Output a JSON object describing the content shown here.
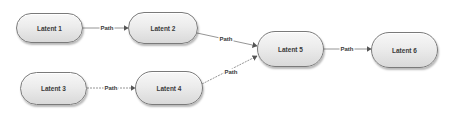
{
  "diagram": {
    "nodes": [
      {
        "id": "latent1",
        "label": "Latent 1",
        "x": 16,
        "y": 13,
        "w": 67,
        "h": 30
      },
      {
        "id": "latent2",
        "label": "Latent 2",
        "x": 128,
        "y": 12,
        "w": 70,
        "h": 32
      },
      {
        "id": "latent3",
        "label": "Latent 3",
        "x": 20,
        "y": 72,
        "w": 67,
        "h": 33
      },
      {
        "id": "latent4",
        "label": "Latent 4",
        "x": 135,
        "y": 71,
        "w": 68,
        "h": 34
      },
      {
        "id": "latent5",
        "label": "Latent 5",
        "x": 257,
        "y": 31,
        "w": 67,
        "h": 36
      },
      {
        "id": "latent6",
        "label": "Latent 6",
        "x": 371,
        "y": 32,
        "w": 67,
        "h": 36
      }
    ],
    "edges": [
      {
        "from": "latent1",
        "to": "latent2",
        "label": "Path"
      },
      {
        "from": "latent2",
        "to": "latent5",
        "label": "Path"
      },
      {
        "from": "latent3",
        "to": "latent4",
        "label": "Path"
      },
      {
        "from": "latent4",
        "to": "latent5",
        "label": "Path"
      },
      {
        "from": "latent5",
        "to": "latent6",
        "label": "Path"
      }
    ]
  },
  "colors": {
    "edge": "#7a7a7a",
    "arrowhead": "#555555",
    "node_border": "#7a7a7a",
    "text": "#3a3a3a"
  }
}
